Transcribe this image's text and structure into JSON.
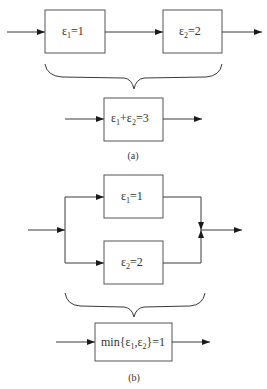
{
  "diagram": {
    "part_a": {
      "caption": "(a)",
      "box1": {
        "symbol": "ε",
        "sub": "1",
        "rest": "=1"
      },
      "box2": {
        "symbol": "ε",
        "sub": "2",
        "rest": "=2"
      },
      "result": {
        "s1": "ε",
        "sub1": "1",
        "plus": "+",
        "s2": "ε",
        "sub2": "2",
        "rest": "=3"
      },
      "connection": "series"
    },
    "part_b": {
      "caption": "(b)",
      "box1": {
        "symbol": "ε",
        "sub": "1",
        "rest": "=1"
      },
      "box2": {
        "symbol": "ε",
        "sub": "2",
        "rest": "=2"
      },
      "result": {
        "prefix": "min{",
        "s1": "ε",
        "sub1": "1",
        "comma": ",",
        "s2": "ε",
        "sub2": "2",
        "rest": "}=1"
      },
      "connection": "parallel"
    }
  }
}
